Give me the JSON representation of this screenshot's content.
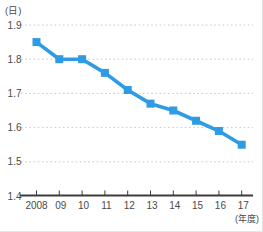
{
  "chart": {
    "unit_label": "(日)",
    "x_unit_label": "(年度)",
    "accent_color": "#2E9BE4",
    "gridline_color": "#C9C9C9",
    "axis_color": "#3C3C3C",
    "text_color": "#4A4A4A",
    "background_color": "#FFFFFF"
  },
  "chart_data": {
    "type": "line",
    "title": "",
    "categories": [
      "2008",
      "09",
      "10",
      "11",
      "12",
      "13",
      "14",
      "15",
      "16",
      "17"
    ],
    "values": [
      1.85,
      1.8,
      1.8,
      1.76,
      1.71,
      1.67,
      1.65,
      1.62,
      1.59,
      1.55
    ],
    "xlabel": "(年度)",
    "ylabel": "(日)",
    "ylim": [
      1.4,
      1.9
    ],
    "yticks": [
      1.9,
      1.8,
      1.7,
      1.6,
      1.5,
      1.4
    ],
    "ytick_labels": [
      "1.9",
      "1.8",
      "1.7",
      "1.6",
      "1.5",
      "1.4"
    ],
    "grid": "horizontal-dotted",
    "legend": "none",
    "marker": "square",
    "line_color": "#2E9BE4"
  }
}
